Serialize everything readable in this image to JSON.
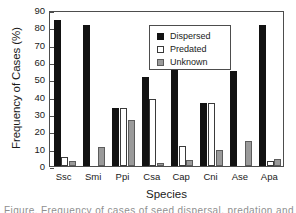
{
  "chart_data": {
    "type": "bar",
    "title": "",
    "xlabel": "Species",
    "ylabel": "Frequency of Cases (%)",
    "ylim": [
      0,
      90
    ],
    "ytick_step": 10,
    "yticks": [
      90,
      80,
      70,
      60,
      50,
      40,
      30,
      20,
      10,
      0
    ],
    "grid": false,
    "legend_position": "top-center",
    "categories": [
      "Ssc",
      "Smi",
      "Ppi",
      "Csa",
      "Cap",
      "Cni",
      "Ase",
      "Apa"
    ],
    "series": [
      {
        "name": "Dispersed",
        "color": "#121212",
        "values": [
          84.2,
          81.5,
          33.2,
          51.3,
          78.7,
          36.5,
          54.8,
          81.5
        ]
      },
      {
        "name": "Predated",
        "color": "#ffffff",
        "values": [
          5.1,
          0.0,
          33.2,
          38.8,
          11.3,
          36.5,
          0.0,
          3.0
        ]
      },
      {
        "name": "Unknown",
        "color": "#9a9a9a",
        "values": [
          2.8,
          11.2,
          26.7,
          1.5,
          3.4,
          9.1,
          14.5,
          4.1
        ]
      }
    ]
  },
  "legend": {
    "items": [
      {
        "label": "Dispersed",
        "swatch": "dispersed"
      },
      {
        "label": "Predated",
        "swatch": "predated"
      },
      {
        "label": "Unknown",
        "swatch": "unknown"
      }
    ]
  },
  "caption": {
    "partial_text": "Figure. Frequency of cases of seed dispersal, predation and unknown fate per species."
  }
}
